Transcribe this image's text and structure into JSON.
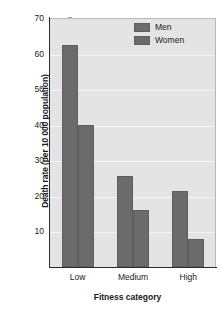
{
  "chart_data": {
    "type": "bar",
    "title": "",
    "xlabel": "Fitness category",
    "ylabel": "Death rate (per 10 000 population)",
    "categories": [
      "Low",
      "Medium",
      "High"
    ],
    "series": [
      {
        "name": "Men",
        "values": [
          62.5,
          25.5,
          21.5
        ]
      },
      {
        "name": "Women",
        "values": [
          40,
          16,
          8
        ]
      }
    ],
    "ylim": [
      0,
      70
    ],
    "yticks": [
      10,
      20,
      30,
      40,
      50,
      60,
      70
    ],
    "ytick_labels": [
      "10",
      "20",
      "30",
      "40",
      "50",
      "60",
      "70"
    ],
    "grid": true,
    "legend_position": "top-right",
    "colors": {
      "bar": "#6b6b6b",
      "bar_edge": "#5e5e5e",
      "plot_background": "#e4e4e4",
      "figure_background": "#ffffff",
      "gridline": "#f4f4f4",
      "axis": "#2b2b2b",
      "text": "#1a1a1a"
    }
  }
}
